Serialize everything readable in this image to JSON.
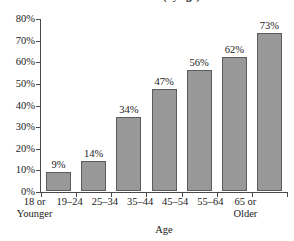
{
  "chart_data": {
    "type": "bar",
    "title": "use the service (by age)",
    "title_note": "title clipped at top edge of screenshot",
    "xlabel": "Age",
    "ylabel": "",
    "categories": [
      "18 or Younger",
      "19–24",
      "25–34",
      "35–44",
      "45–54",
      "55–64",
      "65 or Older"
    ],
    "category_lines": [
      [
        "18 or",
        "Younger"
      ],
      [
        "19–24",
        ""
      ],
      [
        "25–34",
        ""
      ],
      [
        "35–44",
        ""
      ],
      [
        "45–54",
        ""
      ],
      [
        "55–64",
        ""
      ],
      [
        "65 or",
        "Older"
      ]
    ],
    "values": [
      9,
      14,
      34,
      47,
      56,
      62,
      73
    ],
    "data_labels": [
      "9%",
      "14%",
      "34%",
      "47%",
      "56%",
      "62%",
      "73%"
    ],
    "ylim": [
      0,
      80
    ],
    "ytick_values": [
      0,
      10,
      20,
      30,
      40,
      50,
      60,
      70,
      80
    ],
    "ytick_labels": [
      "0%",
      "10%",
      "20%",
      "30%",
      "40%",
      "50%",
      "60%",
      "70%",
      "80%"
    ],
    "grid": false,
    "legend": false,
    "bar_color": "#989898",
    "bar_border_color": "#5c5c5c",
    "axis_color": "#4a4a4a",
    "background_color": "#ffffff"
  }
}
